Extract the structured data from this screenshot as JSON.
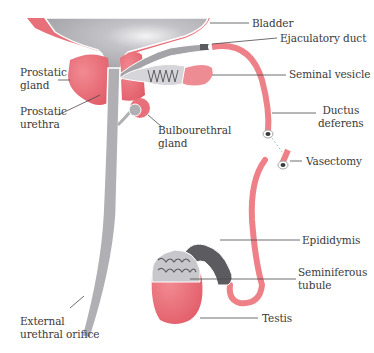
{
  "figure": {
    "colors": {
      "pink": "#e8707a",
      "pink_light": "#f2a8ae",
      "gray": "#a9a9ad",
      "gray_light": "#d6d6da",
      "gray_dark": "#5c5c60",
      "outline": "#ffffff",
      "leader": "#4a4a4a",
      "text": "#3a3a3a"
    },
    "labels": {
      "bladder": "Bladder",
      "ejaculatory_duct": "Ejaculatory duct",
      "seminal_vesicle": "Seminal vesicle",
      "prostatic_gland": "Prostatic\ngland",
      "prostatic_urethra": "Prostatic\nurethra",
      "bulbourethral_gland": "Bulbourethral\ngland",
      "ductus_deferens": "Ductus\ndeferens",
      "vasectomy": "Vasectomy",
      "epididymis": "Epididymis",
      "seminiferous_tubule": "Seminiferous\ntubule",
      "testis": "Testis",
      "external_urethral_orifice": "External\nurethral orifice"
    }
  }
}
